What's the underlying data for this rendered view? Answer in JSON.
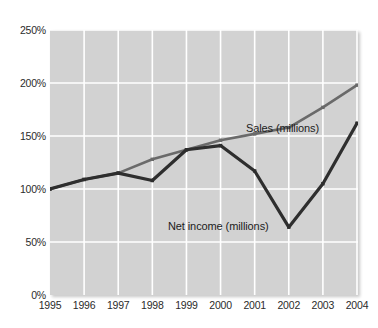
{
  "chart_data": {
    "type": "line",
    "title": "",
    "xlabel": "",
    "ylabel": "",
    "categories": [
      "1995",
      "1996",
      "1997",
      "1998",
      "1999",
      "2000",
      "2001",
      "2002",
      "2003",
      "2004"
    ],
    "ylim": [
      0,
      250
    ],
    "yticks": [
      0,
      50,
      100,
      150,
      200,
      250
    ],
    "ytick_labels": [
      "0%",
      "50%",
      "100%",
      "150%",
      "200%",
      "250%"
    ],
    "grid": true,
    "legend_position": "inline-annotations",
    "series": [
      {
        "name": "Sales (millions)",
        "color": "#6a6a6a",
        "values": [
          100,
          109,
          115,
          128,
          137,
          146,
          152,
          158,
          177,
          198
        ]
      },
      {
        "name": "Net income (millions)",
        "color": "#2e2e2e",
        "values": [
          100,
          109,
          115,
          108,
          137,
          141,
          117,
          64,
          105,
          162
        ]
      }
    ],
    "annotations": [
      {
        "text": "Sales (millions)",
        "series": "Sales (millions)"
      },
      {
        "text": "Net income (millions)",
        "series": "Net income (millions)"
      }
    ],
    "plot_background": "#d2d2d2",
    "gridline_color": "#ffffff"
  }
}
